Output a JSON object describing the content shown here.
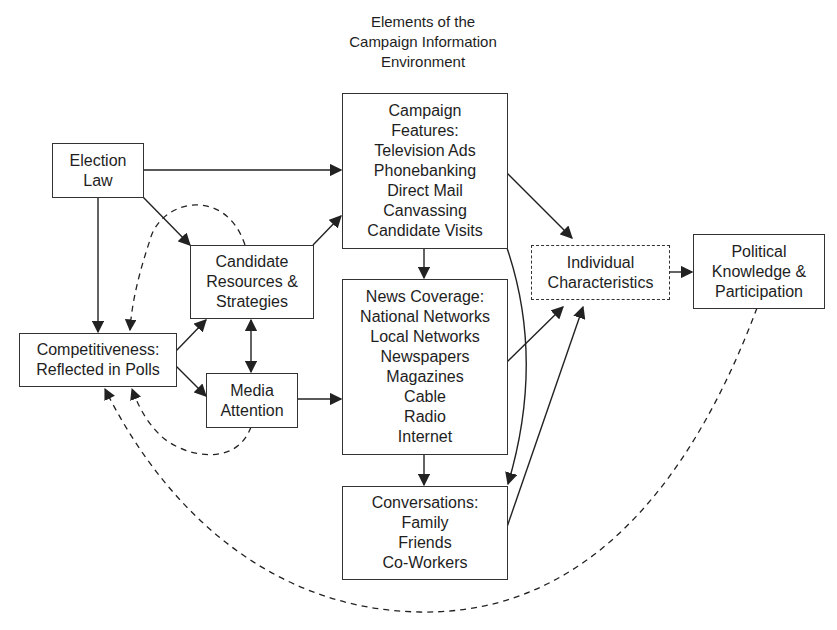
{
  "title": {
    "lines": [
      "Elements of the",
      "Campaign Information",
      "Environment"
    ]
  },
  "nodes": {
    "election_law": {
      "lines": [
        "Election",
        "Law"
      ]
    },
    "campaign_features": {
      "lines": [
        "Campaign",
        "Features:",
        "Television Ads",
        "Phonebanking",
        "Direct Mail",
        "Canvassing",
        "Candidate Visits"
      ]
    },
    "candidate_resources": {
      "lines": [
        "Candidate",
        "Resources &",
        "Strategies"
      ]
    },
    "news_coverage": {
      "lines": [
        "News Coverage:",
        "National Networks",
        "Local Networks",
        "Newspapers",
        "Magazines",
        "Cable",
        "Radio",
        "Internet"
      ]
    },
    "individual_characteristics": {
      "lines": [
        "Individual",
        "Characteristics"
      ],
      "style": "dashed"
    },
    "political_knowledge": {
      "lines": [
        "Political",
        "Knowledge &",
        "Participation"
      ]
    },
    "competitiveness": {
      "lines": [
        "Competitiveness:",
        "Reflected in Polls"
      ]
    },
    "media_attention": {
      "lines": [
        "Media",
        "Attention"
      ]
    },
    "conversations": {
      "lines": [
        "Conversations:",
        "Family",
        "Friends",
        "Co-Workers"
      ]
    }
  },
  "edges": [
    {
      "from": "Election Law",
      "to": "Campaign Features",
      "style": "solid"
    },
    {
      "from": "Election Law",
      "to": "Candidate Resources & Strategies",
      "style": "solid"
    },
    {
      "from": "Election Law",
      "to": "Competitiveness",
      "style": "solid"
    },
    {
      "from": "Candidate Resources & Strategies",
      "to": "Campaign Features",
      "style": "solid"
    },
    {
      "from": "Candidate Resources & Strategies",
      "to": "Media Attention",
      "style": "solid",
      "bidirectional": true
    },
    {
      "from": "Candidate Resources & Strategies",
      "to": "Competitiveness",
      "style": "dashed"
    },
    {
      "from": "Competitiveness",
      "to": "Candidate Resources & Strategies",
      "style": "solid"
    },
    {
      "from": "Competitiveness",
      "to": "Media Attention",
      "style": "solid"
    },
    {
      "from": "Media Attention",
      "to": "Competitiveness",
      "style": "dashed"
    },
    {
      "from": "Media Attention",
      "to": "News Coverage",
      "style": "solid"
    },
    {
      "from": "Campaign Features",
      "to": "News Coverage",
      "style": "solid"
    },
    {
      "from": "Campaign Features",
      "to": "Individual Characteristics",
      "style": "solid"
    },
    {
      "from": "Campaign Features",
      "to": "Conversations",
      "style": "solid"
    },
    {
      "from": "News Coverage",
      "to": "Conversations",
      "style": "solid"
    },
    {
      "from": "News Coverage",
      "to": "Individual Characteristics",
      "style": "solid"
    },
    {
      "from": "Conversations",
      "to": "Individual Characteristics",
      "style": "solid"
    },
    {
      "from": "Individual Characteristics",
      "to": "Political Knowledge & Participation",
      "style": "solid"
    },
    {
      "from": "Political Knowledge & Participation",
      "to": "Competitiveness",
      "style": "dashed"
    }
  ],
  "colors": {
    "line": "#222222",
    "border": "#333333",
    "background": "#ffffff"
  }
}
